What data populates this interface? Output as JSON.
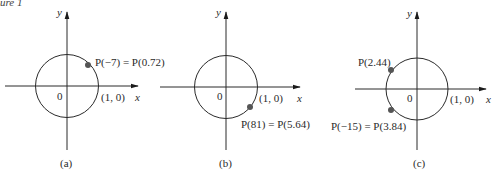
{
  "header": {
    "text": "ure 1"
  },
  "panels": [
    {
      "id": "a",
      "caption": "(a)",
      "axis_x_label": "x",
      "axis_y_label": "y",
      "origin_label": "0",
      "unit_point_label": "(1, 0)",
      "points": [
        {
          "label": "P(−7) = P(0.72)"
        }
      ]
    },
    {
      "id": "b",
      "caption": "(b)",
      "axis_x_label": "x",
      "axis_y_label": "y",
      "origin_label": "0",
      "unit_point_label": "(1, 0)",
      "points": [
        {
          "label": "P(81) = P(5.64)"
        }
      ]
    },
    {
      "id": "c",
      "caption": "(c)",
      "axis_x_label": "x",
      "axis_y_label": "y",
      "origin_label": "0",
      "unit_point_label": "(1, 0)",
      "points": [
        {
          "label": "P(2.44)"
        },
        {
          "label": "P(−15) = P(3.84)"
        }
      ]
    }
  ],
  "colors": {
    "line": "#2a2a2a",
    "point": "#555555"
  }
}
